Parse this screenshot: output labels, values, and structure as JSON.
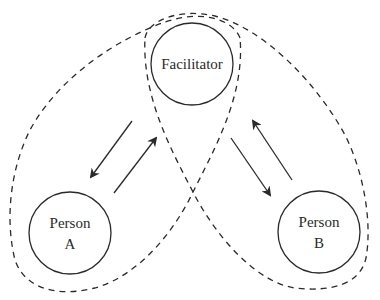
{
  "diagram": {
    "type": "relationship-triad",
    "nodes": [
      {
        "id": "facilitator",
        "label_lines": [
          "Facilitator"
        ],
        "cx": 192,
        "cy": 64,
        "r": 41
      },
      {
        "id": "person-a",
        "label_lines": [
          "Person",
          "A"
        ],
        "cx": 70,
        "cy": 233,
        "r": 41
      },
      {
        "id": "person-b",
        "label_lines": [
          "Person",
          "B"
        ],
        "cx": 319,
        "cy": 232,
        "r": 41
      }
    ],
    "arrows": [
      {
        "from": "facilitator",
        "to": "person-a",
        "direction": "down-left"
      },
      {
        "from": "person-a",
        "to": "facilitator",
        "direction": "up-right"
      },
      {
        "from": "facilitator",
        "to": "person-b",
        "direction": "down-right"
      },
      {
        "from": "person-b",
        "to": "facilitator",
        "direction": "up-left"
      }
    ],
    "groupings": [
      {
        "id": "loop-facilitator-person-a",
        "members": [
          "facilitator",
          "person-a"
        ],
        "style": "dashed"
      },
      {
        "id": "loop-facilitator-person-b",
        "members": [
          "facilitator",
          "person-b"
        ],
        "style": "dashed"
      }
    ],
    "colors": {
      "stroke": "#2a2a2a",
      "background": "#ffffff"
    }
  }
}
